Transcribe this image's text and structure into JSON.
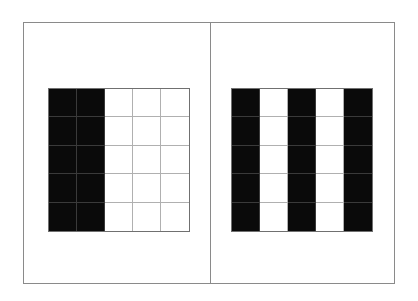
{
  "figure": {
    "panels": [
      {
        "id": "left",
        "rows": 5,
        "cols": 5,
        "pattern": [
          [
            1,
            1,
            0,
            0,
            0
          ],
          [
            1,
            1,
            0,
            0,
            0
          ],
          [
            1,
            1,
            0,
            0,
            0
          ],
          [
            1,
            1,
            0,
            0,
            0
          ],
          [
            1,
            1,
            0,
            0,
            0
          ]
        ]
      },
      {
        "id": "right",
        "rows": 5,
        "cols": 5,
        "pattern": [
          [
            1,
            0,
            1,
            0,
            1
          ],
          [
            1,
            0,
            1,
            0,
            1
          ],
          [
            1,
            0,
            1,
            0,
            1
          ],
          [
            1,
            0,
            1,
            0,
            1
          ],
          [
            1,
            0,
            1,
            0,
            1
          ]
        ]
      }
    ],
    "colors": {
      "filled": "#0a0a0a",
      "empty": "#ffffff",
      "grid_line": "#b0b0b0",
      "frame": "#8a8a8a"
    }
  }
}
